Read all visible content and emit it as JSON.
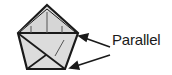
{
  "figure": {
    "label": "Parallel",
    "colors": {
      "fill": "#d9d9d9",
      "stroke": "#1a1a1a",
      "background": "#ffffff"
    },
    "shape": "pentagon"
  }
}
